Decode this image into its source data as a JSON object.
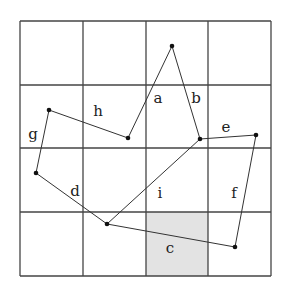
{
  "diagram": {
    "type": "grid-polygon",
    "grid": {
      "rows": 4,
      "cols": 4,
      "x_lines": [
        20,
        83,
        146,
        208,
        271
      ],
      "y_lines": [
        21,
        85,
        148,
        212,
        276
      ],
      "line_color": "#444444",
      "shaded_cell": {
        "row": 3,
        "col": 2,
        "color": "#e3e3e3"
      }
    },
    "vertices": [
      {
        "id": "v1",
        "x": 172,
        "y": 46
      },
      {
        "id": "v2",
        "x": 200,
        "y": 139
      },
      {
        "id": "v3",
        "x": 256,
        "y": 135
      },
      {
        "id": "v4",
        "x": 235,
        "y": 247
      },
      {
        "id": "v5",
        "x": 107,
        "y": 224
      },
      {
        "id": "v6",
        "x": 36,
        "y": 173
      },
      {
        "id": "v7",
        "x": 49,
        "y": 110
      },
      {
        "id": "v8",
        "x": 128,
        "y": 138
      }
    ],
    "edges": [
      {
        "from": "v8",
        "to": "v1"
      },
      {
        "from": "v1",
        "to": "v2"
      },
      {
        "from": "v2",
        "to": "v3"
      },
      {
        "from": "v3",
        "to": "v4"
      },
      {
        "from": "v4",
        "to": "v5"
      },
      {
        "from": "v5",
        "to": "v6"
      },
      {
        "from": "v6",
        "to": "v7"
      },
      {
        "from": "v7",
        "to": "v8"
      },
      {
        "from": "v2",
        "to": "v5"
      }
    ],
    "labels": [
      {
        "text": "a",
        "x": 158,
        "y": 103
      },
      {
        "text": "b",
        "x": 196,
        "y": 103
      },
      {
        "text": "c",
        "x": 170,
        "y": 253
      },
      {
        "text": "d",
        "x": 75,
        "y": 196
      },
      {
        "text": "e",
        "x": 226,
        "y": 132
      },
      {
        "text": "f",
        "x": 234,
        "y": 198
      },
      {
        "text": "g",
        "x": 33,
        "y": 139
      },
      {
        "text": "h",
        "x": 98,
        "y": 116
      },
      {
        "text": "i",
        "x": 160,
        "y": 198
      }
    ]
  }
}
